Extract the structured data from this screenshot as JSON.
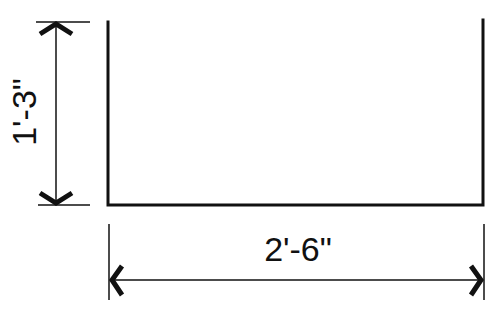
{
  "diagram": {
    "type": "dimensioned-elevation",
    "stroke_color": "#111111",
    "background": "#ffffff",
    "shape": {
      "name": "open-top-rectangle",
      "left_x": 108,
      "right_x": 483,
      "top_y": 21,
      "bottom_y": 205
    },
    "dimensions": {
      "height": {
        "label": "1'-3\"",
        "orientation": "vertical"
      },
      "width": {
        "label": "2'-6\"",
        "orientation": "horizontal"
      }
    }
  }
}
